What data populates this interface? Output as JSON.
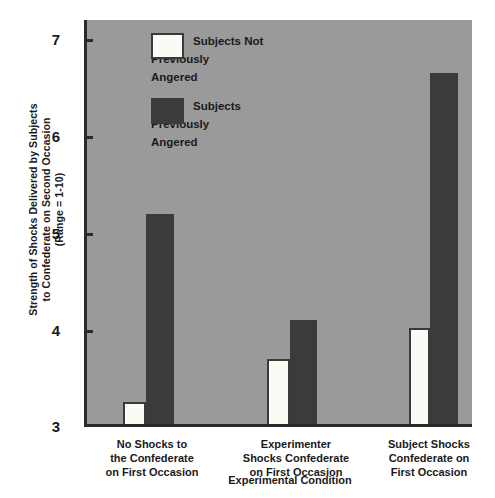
{
  "chart_data": {
    "type": "bar",
    "title": "",
    "xlabel": "Experimental Condition",
    "ylabel": "Strength of Shocks Delivered by Subjects to Confederate on Second Occasion (Range = 1-10)",
    "ylabel_lines": [
      "Strength of Shocks Delivered by Subjects",
      "to Confederate on Second Occasion",
      "(Range = 1-10)"
    ],
    "ylim": [
      3,
      7.35
    ],
    "yticks": [
      3,
      4,
      5,
      6,
      7
    ],
    "ytick_labels": [
      "3",
      "4",
      "5",
      "6",
      "7"
    ],
    "grid": false,
    "legend_position": "top-center-inside",
    "categories": [
      "No Shocks to the Confederate on First Occasion",
      "Experimenter Shocks Confederate on First Occasion",
      "Subject Shocks Confederate on First Occasion"
    ],
    "category_lines": [
      [
        "No Shocks to",
        "the Confederate",
        "on First Occasion"
      ],
      [
        "Experimenter",
        "Shocks Confederate",
        "on First Occasion"
      ],
      [
        "Subject Shocks",
        "Confederate on",
        "First Occasion"
      ]
    ],
    "series": [
      {
        "name": "Subjects Not Previously Angered",
        "name_lines": [
          "Subjects Not",
          "Previously",
          "Angered"
        ],
        "color": "#fbfbf6",
        "values": [
          3.24,
          3.7,
          4.03
        ]
      },
      {
        "name": "Subjects Previously Angered",
        "name_lines": [
          "Subjects",
          "Previously",
          "Angered"
        ],
        "color": "#3b3b3b",
        "values": [
          5.26,
          4.12,
          6.78
        ]
      }
    ]
  },
  "style": {
    "plot_background": "#9a9a9a",
    "page_background": "#ffffff",
    "axis_color": "#2a2a2a",
    "text_color": "#1a1a1a"
  },
  "legend": {
    "items": [
      {
        "label": "Subjects Not\nPreviously\nAngered",
        "swatch": "light"
      },
      {
        "label": "Subjects\nPreviously\nAngered",
        "swatch": "dark"
      }
    ]
  },
  "axis": {
    "y": {
      "ticks": [
        {
          "label": "7"
        },
        {
          "label": "6"
        },
        {
          "label": "5"
        },
        {
          "label": "4"
        },
        {
          "label": "3"
        }
      ],
      "title": "Strength of Shocks Delivered by Subjects\nto Confederate on Second Occasion\n(Range = 1-10)"
    },
    "x": {
      "title": "Experimental Condition",
      "groups": [
        {
          "label": "No Shocks to\nthe Confederate\non First Occasion"
        },
        {
          "label": "Experimenter\nShocks Confederate\non First Occasion"
        },
        {
          "label": "Subject Shocks\nConfederate on\nFirst Occasion"
        }
      ]
    }
  }
}
